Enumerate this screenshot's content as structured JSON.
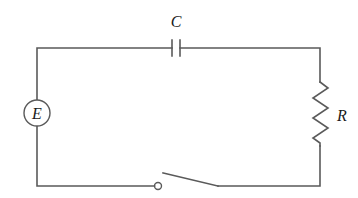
{
  "diagram": {
    "type": "RC circuit with switch",
    "components": {
      "source": {
        "label": "E",
        "kind": "emf-source"
      },
      "capacitor": {
        "label": "C",
        "kind": "capacitor"
      },
      "resistor": {
        "label": "R",
        "kind": "resistor"
      },
      "switch": {
        "kind": "switch",
        "state": "open"
      }
    },
    "colors": {
      "wire": "#5a5a5a",
      "text": "#1a1a1a",
      "background": "#ffffff"
    }
  }
}
